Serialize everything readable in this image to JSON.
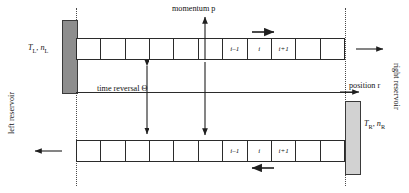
{
  "figure": {
    "type": "diagram",
    "axes": {
      "momentum_label": "momentum p",
      "position_label": "position r"
    },
    "time_reversal_label": "time reversal Θ",
    "reservoirs": {
      "left": {
        "side_label": "left reservoir",
        "state_label": "T",
        "state_label_sub": "L",
        "density_label": "n",
        "density_label_sub": "L",
        "separator": ", ",
        "color": "#8e8e8e"
      },
      "right": {
        "side_label": "right reservoir",
        "state_label": "T",
        "state_label_sub": "R",
        "density_label": "n",
        "density_label_sub": "R",
        "separator": ", ",
        "color": "#d2d2d2"
      }
    },
    "chains": [
      {
        "name": "upper-chain",
        "direction": "rightward",
        "cell_count": 11,
        "cells": [
          "",
          "",
          "",
          "",
          "",
          "",
          "i–1",
          "i",
          "i+1",
          "",
          ""
        ],
        "flow_arrow": "→",
        "exit_arrow": "→"
      },
      {
        "name": "lower-chain",
        "direction": "leftward",
        "cell_count": 11,
        "cells": [
          "",
          "",
          "",
          "",
          "",
          "",
          "i–1",
          "i",
          "i+1",
          "",
          ""
        ],
        "flow_arrow": "←",
        "exit_arrow": "←"
      }
    ],
    "colors": {
      "stroke": "#2b2b2b",
      "dotted": "#4a4a4a",
      "background": "#ffffff"
    }
  }
}
